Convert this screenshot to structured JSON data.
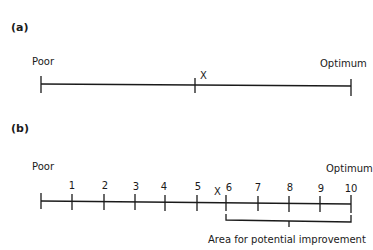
{
  "panel_a": {
    "label": "(a)",
    "left_label": "Poor",
    "right_label": "Optimum",
    "marker": "X"
  },
  "panel_b": {
    "label": "(b)",
    "left_label": "Poor",
    "right_label": "Optimum",
    "marker": "X",
    "ticks": [
      "1",
      "2",
      "3",
      "4",
      "5",
      "6",
      "7",
      "8",
      "9",
      "10"
    ],
    "bracket_label": "Area for potential improvement"
  },
  "colors": {
    "ink": "#1a1a1a",
    "background": "#ffffff"
  }
}
